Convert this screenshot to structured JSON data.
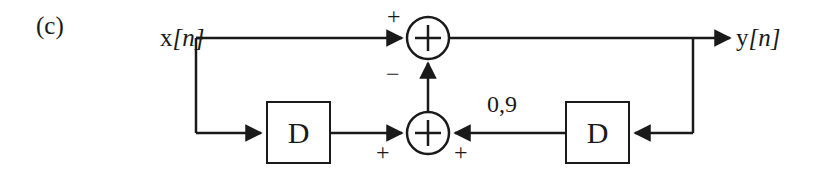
{
  "figure": {
    "panel_label": "(c)",
    "type": "block-diagram"
  },
  "signals": {
    "input_label": "x",
    "input_index": "[n]",
    "output_label": "y",
    "output_index": "[n]"
  },
  "blocks": {
    "delay_left_label": "D",
    "delay_right_label": "D"
  },
  "gain": {
    "value_label": "0,9"
  },
  "adders": {
    "top": {
      "operator": "+",
      "input_sign_left": "+",
      "input_sign_bottom": "−"
    },
    "bottom": {
      "operator": "+",
      "input_sign_left": "+",
      "input_sign_right": "+"
    }
  },
  "style": {
    "line_color": "#1a1a1a",
    "background": "#ffffff"
  }
}
